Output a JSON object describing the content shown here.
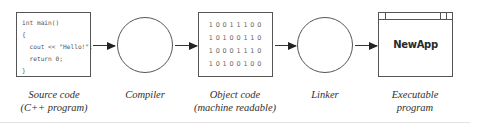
{
  "diagram": {
    "stages": [
      {
        "id": "source",
        "shape": "box",
        "code_lines": [
          "int main()",
          "{",
          "  cout << \"Hello!\";",
          "  return 0;",
          "}"
        ],
        "label_line1": "Source code",
        "label_line2": "(C++ program)"
      },
      {
        "id": "compiler",
        "shape": "circle",
        "label_line1": "Compiler",
        "label_line2": ""
      },
      {
        "id": "object",
        "shape": "box",
        "binary_lines": [
          "10011100",
          "10100110",
          "10001110",
          "10100100"
        ],
        "label_line1": "Object code",
        "label_line2": "(machine readable)"
      },
      {
        "id": "linker",
        "shape": "circle",
        "label_line1": "Linker",
        "label_line2": ""
      },
      {
        "id": "executable",
        "shape": "window",
        "app_name": "NewApp",
        "label_line1": "Executable",
        "label_line2": "program"
      }
    ],
    "arrows": [
      {
        "from": "source",
        "to": "compiler",
        "icon": "arrow-right-icon"
      },
      {
        "from": "compiler",
        "to": "object",
        "icon": "arrow-right-icon"
      },
      {
        "from": "object",
        "to": "linker",
        "icon": "arrow-right-icon"
      },
      {
        "from": "linker",
        "to": "executable",
        "icon": "arrow-right-icon"
      }
    ],
    "colors": {
      "stroke": "#555555",
      "arrow": "#222222",
      "text": "#2a2a2a",
      "code_text": "#555555",
      "rule": "#e2e2e2"
    }
  }
}
